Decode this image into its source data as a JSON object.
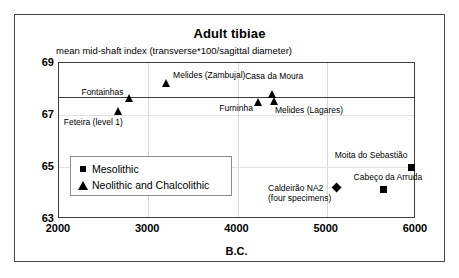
{
  "chart_data": {
    "type": "scatter",
    "title": "Adult tibiae",
    "subtitle": "mean mid-shaft index (transverse*100/sagittal diameter)",
    "xlabel": "B.C.",
    "ylabel": "",
    "xlim": [
      2000,
      6000
    ],
    "ylim": [
      63,
      69
    ],
    "xticks": [
      "2000",
      "3000",
      "4000",
      "5000",
      "6000"
    ],
    "xtick_values": [
      2000,
      3000,
      4000,
      5000,
      6000
    ],
    "yticks": [
      "69",
      "67",
      "65",
      "63"
    ],
    "ytick_values": [
      69,
      67,
      65,
      63
    ],
    "grid": "vertical gridlines at 3000, 4000, 5000; faint horizontal gridlines at 67 and 65",
    "legend_position": "inside lower-left",
    "reference_line": {
      "orientation": "horizontal",
      "value": 67.7,
      "label": ""
    },
    "series": [
      {
        "name": "Mesolithic",
        "marker": "square",
        "points": [
          {
            "label": "Moita do Sebastião",
            "x": 5950,
            "y": 65.0,
            "label_pos": "above-left"
          },
          {
            "label": "Cabeço da Arruda",
            "x": 5640,
            "y": 64.15,
            "label_pos": "above"
          }
        ]
      },
      {
        "name": "Neolithic and Chalcolithic",
        "marker": "triangle",
        "points": [
          {
            "label": "Fontainhas",
            "x": 2790,
            "y": 67.65,
            "label_pos": "above-left"
          },
          {
            "label": "Feteira (level 1)",
            "x": 2670,
            "y": 67.15,
            "label_pos": "below"
          },
          {
            "label": "Melides (Zambujal)",
            "x": 3200,
            "y": 68.25,
            "label_pos": "right"
          },
          {
            "label": "Furninha",
            "x": 4240,
            "y": 67.5,
            "label_pos": "below-left"
          },
          {
            "label": "Casa da Moura",
            "x": 4390,
            "y": 67.8,
            "label_pos": "above"
          },
          {
            "label": "Melides (Lagares)",
            "x": 4420,
            "y": 67.55,
            "label_pos": "below-right"
          }
        ]
      },
      {
        "name": "Caldeirão",
        "marker": "diamond",
        "points": [
          {
            "label": "Caldeirão NA2",
            "label_line2": "(four specimens)",
            "x": 5130,
            "y": 64.15,
            "label_pos": "left"
          }
        ]
      }
    ],
    "legend": [
      {
        "marker": "square",
        "label": "Mesolithic"
      },
      {
        "marker": "triangle",
        "label": "Neolithic and Chalcolithic"
      }
    ]
  }
}
